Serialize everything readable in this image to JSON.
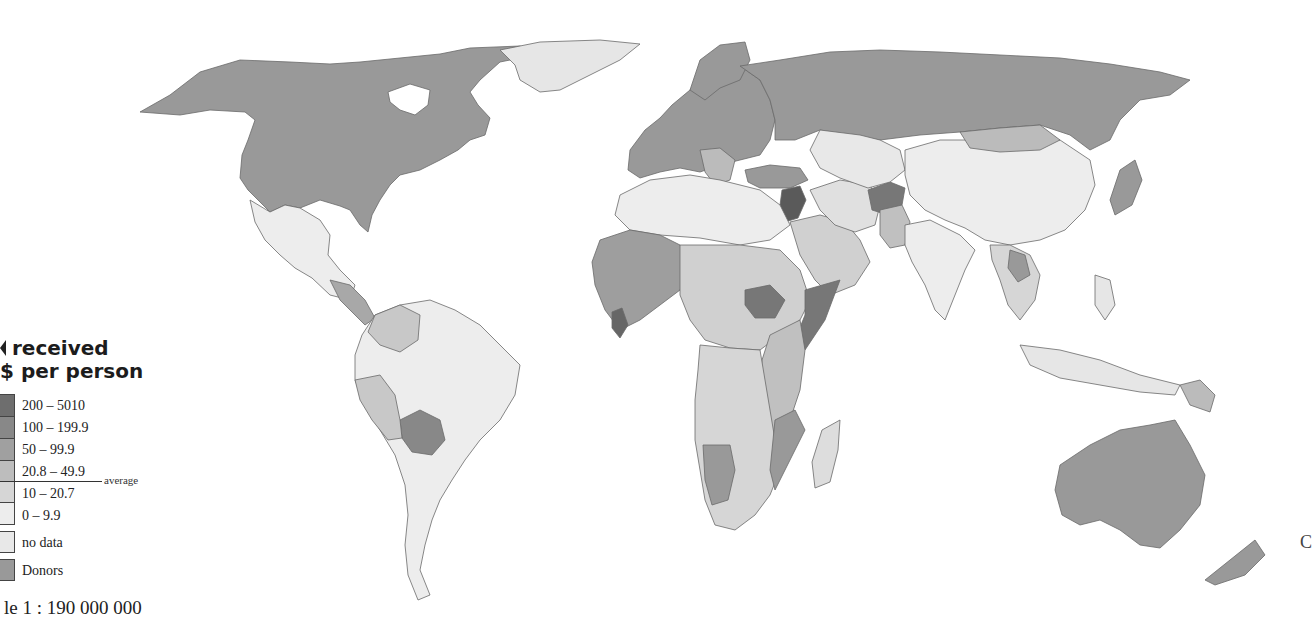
{
  "map": {
    "type": "choropleth world map",
    "projection": "equirectangular-like",
    "scale_text": "le 1 : 190 000 000",
    "edge_text": "C",
    "colors": {
      "water": "#ffffff",
      "border": "#6a6a6a",
      "bin_200_5010": "#6e6e6e",
      "bin_100_199": "#888888",
      "bin_50_99": "#a0a0a0",
      "bin_20_49": "#bdbdbd",
      "bin_10_20": "#d6d6d6",
      "bin_0_9": "#ededed",
      "no_data": "#e6e6e6",
      "donors": "#999999"
    }
  },
  "legend": {
    "title_line1": "received",
    "title_line2": "$ per person",
    "items": [
      {
        "label": "200 – 5010",
        "color": "#6e6e6e"
      },
      {
        "label": "100 – 199.9",
        "color": "#888888"
      },
      {
        "label": "50 – 99.9",
        "color": "#a0a0a0"
      },
      {
        "label": "20.8 – 49.9",
        "color": "#bdbdbd"
      },
      {
        "label": "10 – 20.7",
        "color": "#d6d6d6"
      },
      {
        "label": "0 – 9.9",
        "color": "#ededed"
      }
    ],
    "average_label": "average",
    "no_data_label": "no data",
    "no_data_color": "#e8e8e8",
    "donors_label": "Donors",
    "donors_color": "#999999"
  }
}
